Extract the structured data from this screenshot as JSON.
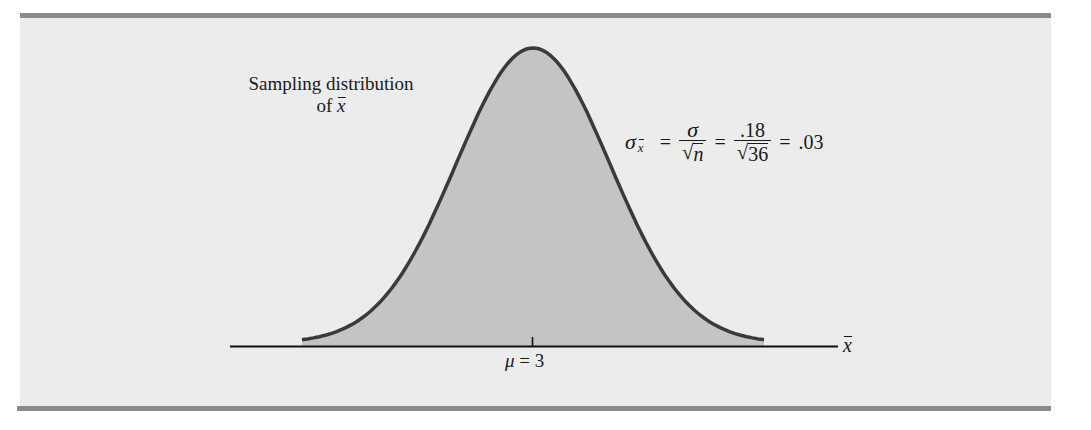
{
  "figure": {
    "background_color": "#ececec",
    "rule_color": "#8a8a8a",
    "fill_color": "#c4c4c4",
    "curve_color": "#3a3a3a",
    "axis_color": "#111111"
  },
  "labels": {
    "distribution_line1": "Sampling distribution",
    "distribution_line2_prefix": "of ",
    "distribution_variable": "x",
    "mean_symbol": "μ",
    "mean_equals": " = 3",
    "axis_variable": "x"
  },
  "formula": {
    "lhs_symbol": "σ",
    "lhs_subscript": "x",
    "equals1": "=",
    "frac1_numerator": "σ",
    "frac1_radical": "√",
    "frac1_radicand": "n",
    "equals2": "=",
    "frac2_numerator": ".18",
    "frac2_radical": "√",
    "frac2_radicand": "36",
    "equals3": "=",
    "result": ".03"
  },
  "chart_data": {
    "type": "area",
    "xlabel": "x̄",
    "ylabel": "",
    "distribution": "normal",
    "mean": 3,
    "standard_error": 0.03,
    "sigma": 0.18,
    "n": 36,
    "x_range": [
      2.91,
      3.09
    ],
    "tick_labels": [
      {
        "x": 3,
        "label": "μ = 3"
      }
    ],
    "annotations": [
      "Sampling distribution of x̄",
      "σx̄ = σ/√n = .18/√36 = .03"
    ],
    "shaded": "entire area under curve",
    "grid": false,
    "legend": null
  }
}
